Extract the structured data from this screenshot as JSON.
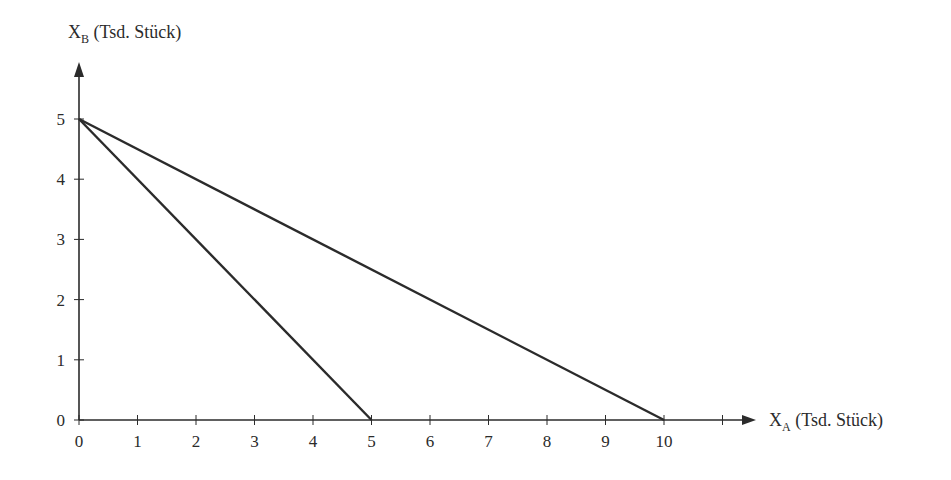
{
  "chart_data": {
    "type": "line",
    "title": "",
    "xlabel": "X_A (Tsd. Stück)",
    "ylabel": "X_B (Tsd. Stück)",
    "xlabel_main": "X",
    "xlabel_sub": "A",
    "xlabel_rest": " (Tsd. Stück)",
    "ylabel_main": "X",
    "ylabel_sub": "B",
    "ylabel_rest": " (Tsd. Stück)",
    "xlim": [
      0,
      11
    ],
    "ylim": [
      0,
      5
    ],
    "x_ticks": [
      "0",
      "1",
      "2",
      "3",
      "4",
      "5",
      "6",
      "7",
      "8",
      "9",
      "10"
    ],
    "y_ticks": [
      "0",
      "1",
      "2",
      "3",
      "4",
      "5"
    ],
    "grid": false,
    "legend": null,
    "series": [
      {
        "name": "line-1",
        "x": [
          0,
          5
        ],
        "y": [
          5,
          0
        ]
      },
      {
        "name": "line-2",
        "x": [
          0,
          10
        ],
        "y": [
          5,
          0
        ]
      }
    ],
    "colors": {
      "line": "#2b2b2b",
      "axis": "#2b2b2b"
    }
  }
}
